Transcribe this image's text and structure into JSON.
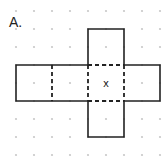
{
  "figure": {
    "label": "A.",
    "center_mark": "x",
    "grid": {
      "type": "dot-grid",
      "spacing": 18,
      "origin": [
        16,
        11
      ],
      "cols": 9,
      "rows": 9,
      "dot_color": "#c8c8c8"
    },
    "net": {
      "description": "cube net: 4 squares in a horizontal row with one square above and one below the third square",
      "line_color": "#222222",
      "solid_outline": [
        [
          16,
          65
        ],
        [
          88,
          65
        ],
        [
          88,
          29
        ],
        [
          124,
          29
        ],
        [
          124,
          65
        ],
        [
          160,
          65
        ],
        [
          160,
          101
        ],
        [
          124,
          101
        ],
        [
          124,
          137
        ],
        [
          88,
          137
        ],
        [
          88,
          101
        ],
        [
          16,
          101
        ]
      ],
      "fold_lines": [
        [
          [
            52,
            65
          ],
          [
            52,
            101
          ]
        ],
        [
          [
            88,
            65
          ],
          [
            88,
            101
          ]
        ],
        [
          [
            124,
            65
          ],
          [
            124,
            101
          ]
        ],
        [
          [
            88,
            65
          ],
          [
            124,
            65
          ]
        ],
        [
          [
            88,
            101
          ],
          [
            124,
            101
          ]
        ]
      ],
      "mark_position": [
        106,
        87
      ]
    }
  }
}
